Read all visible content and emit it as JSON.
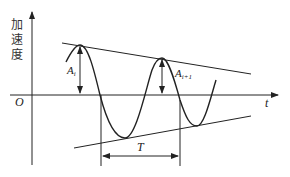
{
  "diagram": {
    "type": "damped-oscillation-acceleration",
    "y_axis_label": [
      "加",
      "速",
      "度"
    ],
    "x_axis_label": "t",
    "origin_label": "O",
    "amplitude_labels": {
      "first": "A",
      "first_sub": "i",
      "second": "A",
      "second_sub": "i+1"
    },
    "period_label": "T",
    "colors": {
      "line": "#222222",
      "background": "#ffffff"
    }
  }
}
